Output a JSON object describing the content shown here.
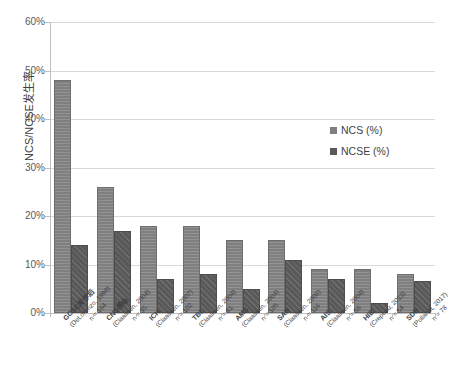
{
  "chart_data": {
    "type": "bar",
    "title": "",
    "xlabel": "",
    "ylabel": "NCS/NCSE发生率",
    "ylim": [
      0,
      60
    ],
    "ytick_labels": [
      "0%",
      "10%",
      "20%",
      "30%",
      "40%",
      "50%",
      "60%"
    ],
    "ytick_values": [
      0,
      10,
      20,
      30,
      40,
      50,
      60
    ],
    "grid": true,
    "legend_position": "right",
    "categories": [
      "GCSE发作后",
      "CNS感染",
      "ICH",
      "TBI",
      "AMS",
      "SAH",
      "AIS",
      "HIE",
      "SDH"
    ],
    "category_citations": [
      "(DeLorenzo, 1998)",
      "(Claassen, 2004)",
      "(Claassen, 2007)",
      "(Claassen, 2004)",
      "(Claassen, 2004)",
      "(Claassen, 2006)",
      "(Claassen, 2004)",
      "(Crepeau, 2013)",
      "(Pollandt, 2017)"
    ],
    "category_sample_sizes": [
      "n = 164",
      "n = 35",
      "n = 102",
      "n = 81",
      "n = 105",
      "n = 116",
      "n = 56",
      "n = 54",
      "n = 78"
    ],
    "series": [
      {
        "name": "NCS (%)",
        "color": "#7f7f7f",
        "values": [
          48,
          26,
          18,
          18,
          15,
          15,
          9,
          9,
          8
        ]
      },
      {
        "name": "NCSE (%)",
        "color": "#595959",
        "values": [
          14,
          17,
          7,
          8,
          5,
          11,
          7,
          2,
          6.5
        ]
      }
    ]
  }
}
